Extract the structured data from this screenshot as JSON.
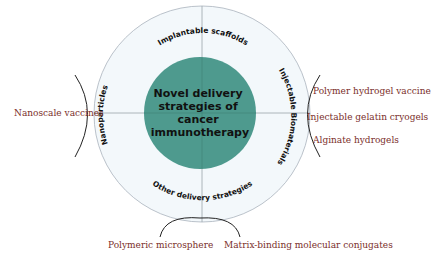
{
  "diagram": {
    "center_label": [
      "Novel delivery",
      "strategies of",
      "cancer",
      "immunotherapy"
    ],
    "ring_labels": {
      "top": "Implantable scaffolds",
      "right": "Injectable Biomaterials",
      "bottom": "Other delivery strategies",
      "left": "Nanoparticles"
    },
    "branches": {
      "left": [
        "Nanoscale vaccines"
      ],
      "right": [
        "Polymer hydrogel vaccine",
        "Injectable gelatin cryogels",
        "Alginate hydrogels"
      ],
      "bottom": [
        "Polymeric microsphere",
        "Matrix-binding molecular conjugates"
      ]
    },
    "colors": {
      "center_fill": "#4e9a8e",
      "ring_fill": "#f3f8fb",
      "ring_stroke": "#a9b3bd",
      "branch_text": "#7a2e2a",
      "ring_text": "#111111"
    }
  }
}
